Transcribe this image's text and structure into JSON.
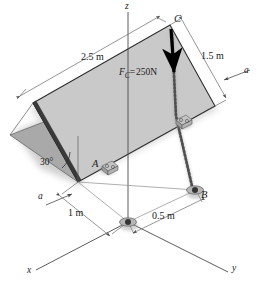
{
  "figure": {
    "background_color": "#ffffff",
    "plate_fill": "#c9c9c9",
    "plate_shadow_fill": "#a9a9a9",
    "line_color": "#3c3c3c",
    "force_color": "#000000"
  },
  "axes": {
    "x_label": "x",
    "y_label": "y",
    "z_label": "z"
  },
  "points": {
    "a_label": "A",
    "b_label": "B",
    "c_label": "C"
  },
  "dimensions": {
    "plate_long": "2.5 m",
    "plate_short": "1.5 m",
    "ground_x": "1 m",
    "ground_y": "0.5 m",
    "incline_angle": "30°"
  },
  "section": {
    "left_label": "a",
    "right_label": "a"
  },
  "force": {
    "symbol": "F",
    "subscript": "C",
    "equals": "=",
    "magnitude": "250N",
    "full_label": "F_C = 250N",
    "direction": "downward"
  },
  "hardware": {
    "hinge_a": "hinge-bracket",
    "hinge_right": "hinge-bracket",
    "support_origin": "ball-support",
    "support_b": "ball-support",
    "chain": "chain-link-cable"
  }
}
